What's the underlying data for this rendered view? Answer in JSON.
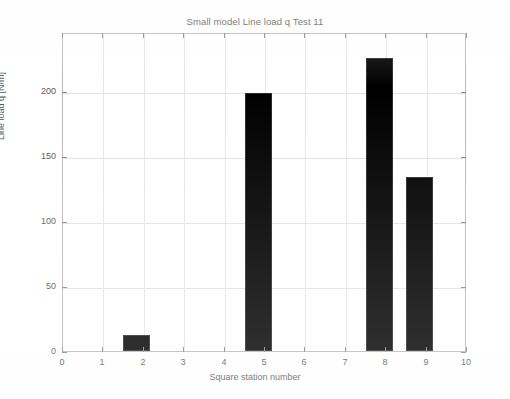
{
  "chart_data": {
    "type": "bar",
    "title": "Small model Line load q Test 11",
    "xlabel": "Square station number",
    "ylabel": "Line load q [N/m]",
    "categories": [
      1,
      2,
      3,
      4,
      5,
      6,
      7,
      8,
      9
    ],
    "values": [
      0,
      12.5,
      0,
      0,
      198,
      0,
      0,
      225,
      134
    ],
    "bar_color": "#000000",
    "bar_width": 0.67,
    "xlim": [
      0,
      10
    ],
    "ylim": [
      0,
      245
    ],
    "xticks": [
      0,
      1,
      2,
      3,
      4,
      5,
      6,
      7,
      8,
      9,
      10
    ],
    "xtick_labels": [
      "0",
      "1",
      "2",
      "3",
      "4",
      "5",
      "6",
      "7",
      "8",
      "9",
      "10"
    ],
    "yticks": [
      0,
      50,
      100,
      150,
      200
    ],
    "ytick_labels": [
      "0",
      "50",
      "100",
      "150",
      "200"
    ],
    "grid": true,
    "legend": null,
    "background": "#ffffff",
    "axis_color": "#b9b9b9",
    "grid_color": "#e2e2e2",
    "text_color": "#5a5a5a"
  }
}
